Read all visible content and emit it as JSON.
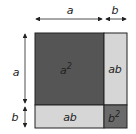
{
  "diagram": {
    "top_labels": {
      "a": "a",
      "b": "b"
    },
    "side_labels": {
      "a": "a",
      "b": "b"
    },
    "regions": [
      {
        "id": "a2",
        "base": "a",
        "exp": "2",
        "color": "#555555"
      },
      {
        "id": "ab_right",
        "text": "ab",
        "color": "#d6d6d6"
      },
      {
        "id": "ab_bottom",
        "text": "ab",
        "color": "#d6d6d6"
      },
      {
        "id": "b2",
        "base": "b",
        "exp": "2",
        "color": "#6a6a6a"
      }
    ]
  }
}
